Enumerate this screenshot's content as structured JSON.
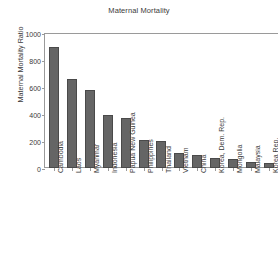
{
  "chart_data": {
    "type": "bar",
    "title": "Maternal Mortality",
    "xlabel": "",
    "ylabel": "Maternal Mortality Ratio",
    "ylim": [
      0,
      1000
    ],
    "yticks": [
      0,
      200,
      400,
      600,
      800,
      1000
    ],
    "grid": false,
    "legend": null,
    "bar_color": "#656565",
    "categories": [
      "Cambodia",
      "Laos",
      "Myanmar",
      "Indonesia",
      "Papua New Guinea",
      "Philippines",
      "Thailand",
      "Vietnam",
      "China",
      "Korea, Dem. Rep.",
      "Mongolia",
      "Malaysia",
      "Korea Rep."
    ],
    "values": [
      900,
      660,
      580,
      390,
      370,
      210,
      200,
      110,
      95,
      75,
      70,
      41,
      35
    ]
  }
}
